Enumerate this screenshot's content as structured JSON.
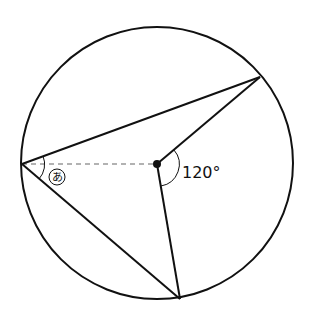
{
  "diagram": {
    "type": "circle inscribed angle figure",
    "angle_label": "120°",
    "unknown_angle_label": "あ",
    "colors": {
      "stroke": "#111111",
      "dashed": "#999999",
      "background": "#ffffff"
    }
  }
}
